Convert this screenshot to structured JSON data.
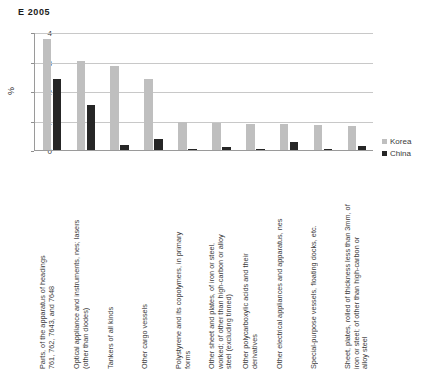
{
  "chart_data": {
    "type": "bar",
    "title": "E  2005",
    "xlabel": "",
    "ylabel": "%",
    "ylim": [
      0,
      4
    ],
    "yticks": [
      0,
      1,
      2,
      3,
      4
    ],
    "ytick_labels": [
      "0",
      "1",
      "2",
      "3",
      "4"
    ],
    "grid": true,
    "legend_position": "right",
    "categories": [
      "Parts, of the apparatus of headings\n761, 762, 7643, and 7648",
      "Optical appliance and instruments, nes; lasers\n(other than diodes)",
      "Tankers of all kinds",
      "Other cargo vessels",
      "Polystyrene and its copolymers, in primary\nforms",
      "Other sheet and plates, of iron or steel,\nworked; of other than high-carbon or alloy\nsteel (excluding tinned)",
      "Other polycarboxylic acids and their\nderivatives",
      "Other electrical appliances and apparatus, nes",
      "Special-purpose vessels, floating docks, etc.",
      "Sheet, plates, rolled of thickness less than 3mm, of\niron or steel; of other than high-carbon or\nalloy steel"
    ],
    "series": [
      {
        "name": "Korea",
        "color": "#bfbfbf",
        "values": [
          3.78,
          3.02,
          2.85,
          2.4,
          0.95,
          0.92,
          0.88,
          0.87,
          0.84,
          0.82
        ]
      },
      {
        "name": "China",
        "color": "#262626",
        "values": [
          2.4,
          1.52,
          0.17,
          0.39,
          0.03,
          0.1,
          0.05,
          0.28,
          0.04,
          0.15
        ]
      }
    ]
  }
}
